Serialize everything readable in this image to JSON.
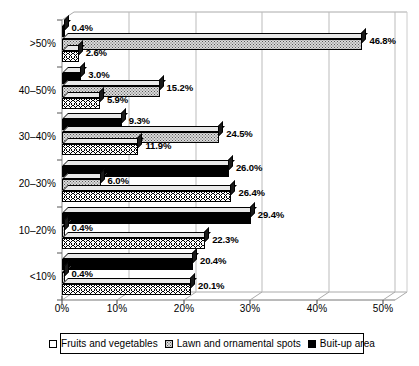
{
  "chart_data": {
    "type": "bar",
    "orientation": "horizontal",
    "grouped": true,
    "title": "",
    "subtitle": "",
    "xlabel": "",
    "ylabel": "",
    "xlim": [
      0,
      55
    ],
    "xticks": [
      0,
      10,
      20,
      30,
      40,
      50
    ],
    "xticklabels": [
      "0%",
      "10%",
      "20%",
      "30%",
      "40%",
      "50%"
    ],
    "grid": "vertical",
    "legend_position": "bottom",
    "categories": [
      ">50%",
      "40–50%",
      "30–40%",
      "20–30%",
      "10–20%",
      "<10%"
    ],
    "series": [
      {
        "name": "Fruits and vegetables",
        "pattern": "zigzag-white",
        "color": "#ffffff",
        "values": [
          2.6,
          5.9,
          11.9,
          26.4,
          22.3,
          20.1
        ],
        "labels": [
          "2.6%",
          "5.9%",
          "11.9%",
          "26.4%",
          "22.3%",
          "20.1%"
        ]
      },
      {
        "name": "Lawn and ornamental spots",
        "pattern": "dotted-gray",
        "color": "#d9d9d9",
        "values": [
          46.8,
          15.2,
          24.5,
          6.0,
          0.4,
          0.4
        ],
        "labels": [
          "46.8%",
          "15.2%",
          "24.5%",
          "6.0%",
          "0.4%",
          "0.4%"
        ]
      },
      {
        "name": "Buit-up area",
        "pattern": "solid-black",
        "color": "#000000",
        "values": [
          0.4,
          3.0,
          9.3,
          26.0,
          29.4,
          20.4
        ],
        "labels": [
          "0.4%",
          "3.0%",
          "9.3%",
          "26.0%",
          "29.4%",
          "20.4%"
        ]
      }
    ]
  },
  "legend": {
    "items": [
      {
        "label": "Fruits and vegetables",
        "swatch": "white-square"
      },
      {
        "label": "Lawn and ornamental spots",
        "swatch": "dotted-square"
      },
      {
        "label": "Buit-up area",
        "swatch": "black-square"
      }
    ]
  }
}
